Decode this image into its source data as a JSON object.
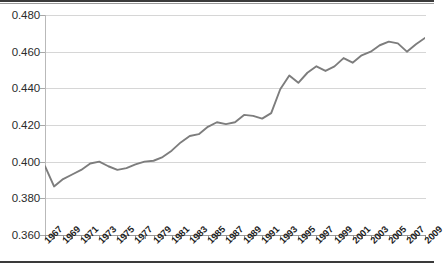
{
  "chart_data": {
    "type": "line",
    "title": "",
    "subtitle": "",
    "xlabel": "",
    "ylabel": "",
    "ylim": [
      0.36,
      0.48
    ],
    "ytick_labels": [
      "0.480",
      "0.460",
      "0.440",
      "0.420",
      "0.400",
      "0.380",
      "0.360"
    ],
    "ytick_values": [
      0.48,
      0.46,
      0.44,
      0.42,
      0.4,
      0.38,
      0.36
    ],
    "xlim": [
      1967,
      2009
    ],
    "xtick_labels": [
      "1967",
      "1969",
      "1971",
      "1973",
      "1975",
      "1977",
      "1979",
      "1981",
      "1983",
      "1985",
      "1987",
      "1989",
      "1991",
      "1993",
      "1995",
      "1997",
      "1999",
      "2001",
      "2003",
      "2005",
      "2007",
      "2009"
    ],
    "grid": true,
    "legend": null,
    "legend_position": "none",
    "series_color": "#7d7d7d",
    "x": [
      1967,
      1968,
      1969,
      1970,
      1971,
      1972,
      1973,
      1974,
      1975,
      1976,
      1977,
      1978,
      1979,
      1980,
      1981,
      1982,
      1983,
      1984,
      1985,
      1986,
      1987,
      1988,
      1989,
      1990,
      1991,
      1992,
      1993,
      1994,
      1995,
      1996,
      1997,
      1998,
      1999,
      2000,
      2001,
      2002,
      2003,
      2004,
      2005,
      2006,
      2007,
      2008,
      2009
    ],
    "values": [
      0.3975,
      0.3865,
      0.3905,
      0.393,
      0.3955,
      0.399,
      0.4,
      0.3975,
      0.3955,
      0.3965,
      0.3985,
      0.4,
      0.4005,
      0.4025,
      0.406,
      0.4105,
      0.414,
      0.415,
      0.419,
      0.4215,
      0.4205,
      0.4215,
      0.4255,
      0.425,
      0.4235,
      0.4265,
      0.4395,
      0.447,
      0.443,
      0.4485,
      0.452,
      0.4495,
      0.452,
      0.4565,
      0.454,
      0.458,
      0.46,
      0.4635,
      0.4655,
      0.4645,
      0.46,
      0.464,
      0.4675
    ]
  },
  "axis": {
    "y_tick_count": 7,
    "x_tick_count": 43
  }
}
